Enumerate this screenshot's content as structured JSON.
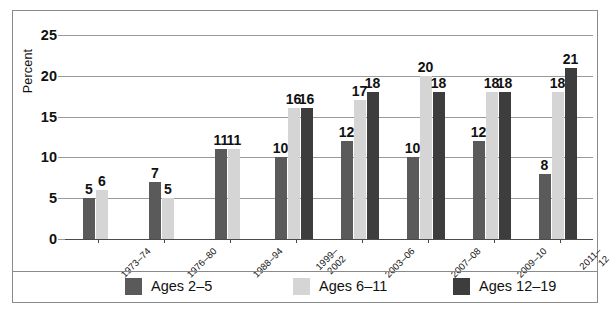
{
  "chart_data": {
    "type": "bar",
    "title": "",
    "xlabel": "",
    "ylabel": "Percent",
    "ylim": [
      0,
      25
    ],
    "yticks": [
      0,
      5,
      10,
      15,
      20,
      25
    ],
    "grid": true,
    "legend_position": "bottom",
    "categories": [
      "1973–74",
      "1976–80",
      "1988–94",
      "1999–\n2002",
      "2003–06",
      "2007–08",
      "2009–10",
      "2011–12"
    ],
    "series": [
      {
        "name": "Ages 2–5",
        "color": "#5a5a5a",
        "values": [
          5,
          7,
          11,
          10,
          12,
          10,
          12,
          8
        ]
      },
      {
        "name": "Ages 6–11",
        "color": "#d5d5d5",
        "values": [
          6,
          5,
          11,
          16,
          17,
          20,
          18,
          18
        ]
      },
      {
        "name": "Ages 12–19",
        "color": "#3d3d3d",
        "values": [
          null,
          null,
          null,
          16,
          18,
          18,
          18,
          21
        ]
      }
    ]
  },
  "legend": {
    "items": [
      {
        "label": "Ages 2–5",
        "swatch": "s0"
      },
      {
        "label": "Ages 6–11",
        "swatch": "s1"
      },
      {
        "label": "Ages 12–19",
        "swatch": "s2"
      }
    ]
  }
}
